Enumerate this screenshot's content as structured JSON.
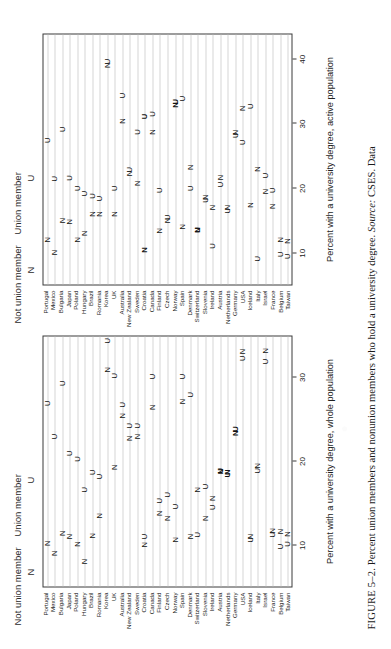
{
  "figure": {
    "caption_label": "FIGURE 5–2.",
    "caption_text": " Percent union members and nonunion members who hold a university degree. ",
    "caption_source_label": "Source:",
    "caption_source_text": " CSES. Data"
  },
  "legend": {
    "not_union_label": "Not union member",
    "not_union_symbol": "N",
    "union_label": "Union member",
    "union_symbol": "U"
  },
  "chart_data": [
    {
      "id": "whole-population",
      "type": "scatter",
      "title": "",
      "xlabel": "Percent with a university degree, whole population",
      "ylabel": "",
      "xlim": [
        5,
        35
      ],
      "xticks": [
        10,
        20,
        30
      ],
      "xticklabels": [
        "10",
        "20",
        "30"
      ],
      "grid": true,
      "legend_position": "top-left",
      "categories": [
        "Portugal",
        "Mexico",
        "Bulgaria",
        "Japan",
        "Poland",
        "Hungary",
        "Brazil",
        "Romania",
        "Korea",
        "UK",
        "Australia",
        "New Zealand",
        "Sweden",
        "Croatia",
        "Canada",
        "Finland",
        "Czech",
        "Norway",
        "Spain",
        "Denmark",
        "Switzerland",
        "Slovenia",
        "Ireland",
        "Austria",
        "Netherlands",
        "Germany",
        "USA",
        "Iceland",
        "Italy",
        "Israel",
        "France",
        "Belgium",
        "Taiwan"
      ],
      "series": [
        {
          "name": "Not union member",
          "marker": "N",
          "values": [
            10.2,
            9.0,
            11.4,
            11.0,
            10.1,
            8.0,
            11.1,
            13.5,
            31.0,
            19.3,
            25.5,
            22.8,
            23.0,
            10.0,
            26.5,
            13.8,
            13.2,
            10.6,
            27.2,
            11.0,
            16.6,
            13.2,
            15.6,
            18.8,
            18.7,
            23.4,
            33.2,
            11.0,
            19.5,
            33.3,
            11.7,
            11.6,
            11.3
          ]
        },
        {
          "name": "Union member",
          "marker": "U",
          "values": [
            27.0,
            23.0,
            29.4,
            21.0,
            20.3,
            16.6,
            18.7,
            18.2,
            34.5,
            30.3,
            26.8,
            24.3,
            24.3,
            11.0,
            30.2,
            15.3,
            16.0,
            14.6,
            30.2,
            28.0,
            11.2,
            17.0,
            14.5,
            18.9,
            18.4,
            23.9,
            32.4,
            10.6,
            18.9,
            32.0,
            11.2,
            9.8,
            10.1
          ]
        }
      ],
      "bold_markers": [
        "Austria",
        "Netherlands",
        "Germany"
      ]
    },
    {
      "id": "active-population",
      "type": "scatter",
      "title": "",
      "xlabel": "Percent with a university degree, active population",
      "ylabel": "",
      "xlim": [
        5,
        44
      ],
      "xticks": [
        10,
        20,
        30,
        40
      ],
      "xticklabels": [
        "10",
        "20",
        "30",
        "40"
      ],
      "grid": true,
      "legend_position": "top-left",
      "categories": [
        "Portugal",
        "Mexico",
        "Bulgaria",
        "Japan",
        "Poland",
        "Hungary",
        "Brazil",
        "Romania",
        "Korea",
        "UK",
        "Australia",
        "New Zealand",
        "Sweden",
        "Croatia",
        "Canada",
        "Finland",
        "Czech",
        "Norway",
        "Spain",
        "Denmark",
        "Switzerland",
        "Slovenia",
        "Ireland",
        "Austria",
        "Netherlands",
        "Germany",
        "USA",
        "Iceland",
        "Italy",
        "Israel",
        "France",
        "Belgium",
        "Taiwan"
      ],
      "series": [
        {
          "name": "Not union member",
          "marker": "N",
          "values": [
            12.0,
            10.0,
            15.0,
            14.8,
            12.0,
            13.0,
            16.0,
            16.0,
            39.2,
            16.0,
            30.5,
            22.3,
            20.8,
            10.4,
            28.8,
            13.4,
            15.0,
            33.0,
            14.0,
            23.3,
            13.5,
            18.6,
            17.0,
            21.7,
            17.0,
            28.7,
            32.5,
            17.4,
            23.0,
            19.5,
            17.2,
            12.0,
            11.8
          ]
        },
        {
          "name": "Union member",
          "marker": "U",
          "values": [
            27.5,
            21.5,
            29.2,
            21.6,
            20.0,
            19.2,
            18.8,
            18.4,
            39.8,
            20.0,
            34.5,
            22.9,
            28.8,
            31.2,
            31.6,
            19.7,
            15.5,
            33.5,
            34.0,
            20.0,
            13.5,
            18.2,
            11.0,
            20.6,
            16.5,
            28.3,
            27.2,
            32.8,
            9.0,
            22.0,
            19.7,
            9.7,
            9.4
          ]
        }
      ],
      "bold_markers": [
        "Croatia",
        "Norway",
        "Switzerland"
      ]
    }
  ]
}
